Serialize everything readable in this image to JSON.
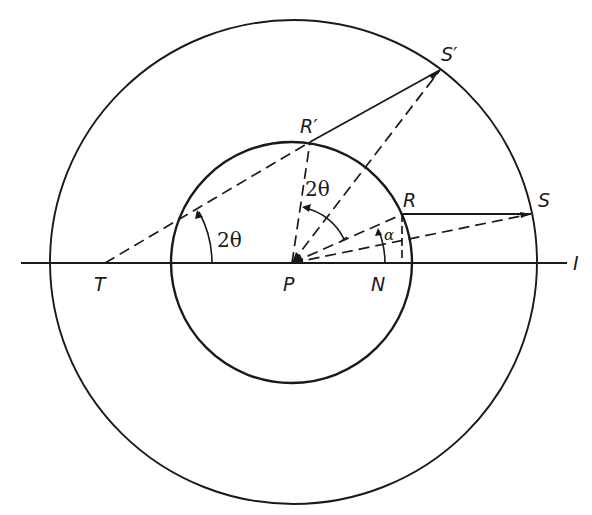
{
  "figure": {
    "type": "geometric construction",
    "background": "#ffffff",
    "ink_color": "#1a1a1a",
    "circles": [
      {
        "name": "outer-circle",
        "center": "P",
        "style": "solid"
      },
      {
        "name": "inner-circle",
        "center": "P",
        "style": "solid"
      }
    ],
    "points": {
      "P": "P",
      "T": "T",
      "N": "N",
      "R": "R",
      "R_prime": "R′",
      "S": "S",
      "S_prime": "S′",
      "I": "I"
    },
    "segments": [
      {
        "from": "T",
        "to": "I",
        "style": "solid",
        "note": "horizontal line through P"
      },
      {
        "from": "R",
        "to": "S",
        "style": "solid"
      },
      {
        "from": "R′",
        "to": "S′",
        "style": "solid"
      },
      {
        "from": "T",
        "to": "R′",
        "style": "dashed"
      },
      {
        "from": "P",
        "to": "R′",
        "style": "dashed"
      },
      {
        "from": "P",
        "to": "S′",
        "style": "dashed"
      },
      {
        "from": "P",
        "to": "R",
        "style": "dashed"
      },
      {
        "from": "P",
        "to": "S",
        "style": "dashed"
      },
      {
        "from": "R",
        "to": "N",
        "style": "dashed",
        "note": "perpendicular to line"
      }
    ],
    "angles": [
      {
        "name": "angle-at-T",
        "label": "2θ",
        "vertex": "T"
      },
      {
        "name": "angle-R-P-Rprime",
        "label": "2θ",
        "vertex": "P"
      },
      {
        "name": "angle-N-P-R",
        "label": "α",
        "vertex": "P"
      }
    ]
  },
  "labels": {
    "T": "T",
    "P": "P",
    "N": "N",
    "R": "R",
    "R_prime": "R′",
    "S": "S",
    "S_prime": "S′",
    "I": "I",
    "angle_T": "2θ",
    "angle_P": "2θ",
    "alpha": "α"
  }
}
